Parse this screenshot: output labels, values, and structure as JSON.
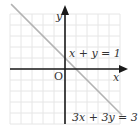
{
  "diagram": {
    "axes": {
      "x_label": "x",
      "y_label": "y",
      "origin_label": "O"
    },
    "grid": {
      "x_range": [
        -5,
        5
      ],
      "y_range": [
        -5,
        5
      ]
    },
    "lines": [
      {
        "equation": "x + y = 1",
        "slope": -1,
        "intercept": 1
      },
      {
        "equation": "3x + 3y = 3",
        "slope": -1,
        "intercept": 1
      }
    ],
    "colors": {
      "grid": "#e6e6e6",
      "axis": "#1a1a1a",
      "line": "#b3b3b3"
    }
  }
}
